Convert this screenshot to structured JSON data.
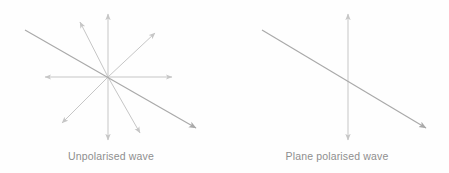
{
  "figure": {
    "background_color": "#fefefe",
    "caption_color": "#8e8e8e",
    "line_color_light": "#c6c6c6",
    "line_color_dark": "#a9a9a9",
    "width": 449,
    "height": 173
  },
  "panels": [
    {
      "id": "unpolarised",
      "caption": "Unpolarised wave",
      "center": {
        "x": 108,
        "y": 77
      },
      "description": "Eight light double-ended vibration directions radiating from a common centre, plus one long darker diagonal arrow running from upper-left to lower-right.",
      "arrows": [
        {
          "name": "vertical-up",
          "x1": 108,
          "y1": 77,
          "x2": 108,
          "y2": 14,
          "arrowhead": "end",
          "weight": "light"
        },
        {
          "name": "vertical-down",
          "x1": 108,
          "y1": 77,
          "x2": 108,
          "y2": 140,
          "arrowhead": "end",
          "weight": "light"
        },
        {
          "name": "horizontal-left",
          "x1": 108,
          "y1": 77,
          "x2": 45,
          "y2": 77,
          "arrowhead": "end",
          "weight": "light"
        },
        {
          "name": "horizontal-right",
          "x1": 108,
          "y1": 77,
          "x2": 172,
          "y2": 77,
          "arrowhead": "end",
          "weight": "light"
        },
        {
          "name": "diagonal-northeast",
          "x1": 108,
          "y1": 77,
          "x2": 155,
          "y2": 33,
          "arrowhead": "end",
          "weight": "light"
        },
        {
          "name": "diagonal-southwest",
          "x1": 108,
          "y1": 77,
          "x2": 62,
          "y2": 123,
          "arrowhead": "end",
          "weight": "light"
        },
        {
          "name": "diagonal-northwest",
          "x1": 108,
          "y1": 77,
          "x2": 80,
          "y2": 22,
          "arrowhead": "end",
          "weight": "light"
        },
        {
          "name": "diagonal-southeast",
          "x1": 108,
          "y1": 77,
          "x2": 140,
          "y2": 133,
          "arrowhead": "end",
          "weight": "light"
        },
        {
          "name": "propagation-ray",
          "x1": 25,
          "y1": 30,
          "x2": 196,
          "y2": 128,
          "arrowhead": "end",
          "weight": "dark"
        }
      ]
    },
    {
      "id": "plane-polarised",
      "caption": "Plane polarised wave",
      "center": {
        "x": 348,
        "y": 77
      },
      "description": "A single vertical double-headed vibration arrow crossed by one long darker diagonal arrow running from upper-left to lower-right.",
      "arrows": [
        {
          "name": "vertical-up",
          "x1": 348,
          "y1": 77,
          "x2": 348,
          "y2": 14,
          "arrowhead": "end",
          "weight": "light"
        },
        {
          "name": "vertical-down",
          "x1": 348,
          "y1": 77,
          "x2": 348,
          "y2": 140,
          "arrowhead": "end",
          "weight": "light"
        },
        {
          "name": "propagation-ray",
          "x1": 262,
          "y1": 30,
          "x2": 426,
          "y2": 128,
          "arrowhead": "end",
          "weight": "dark"
        }
      ]
    }
  ]
}
